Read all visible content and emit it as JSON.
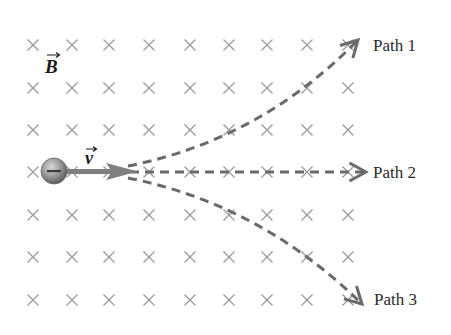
{
  "diagram": {
    "field": {
      "symbol": "B",
      "direction": "into-page",
      "marker": "×",
      "marker_color": "#9a9a9a",
      "columns_x": [
        33,
        72,
        109,
        149,
        190,
        229,
        267,
        307,
        348
      ],
      "rows_y": [
        45,
        88,
        130,
        172,
        215,
        257,
        300
      ]
    },
    "particle": {
      "charge_sign": "−",
      "center": [
        54,
        171
      ],
      "radius": 13,
      "color": "#8a8a8a"
    },
    "velocity": {
      "symbol": "v",
      "color": "#7f7f7f"
    },
    "paths": [
      {
        "label": "Path 1",
        "color": "#6a6a6a"
      },
      {
        "label": "Path 2",
        "color": "#6a6a6a"
      },
      {
        "label": "Path 3",
        "color": "#6a6a6a"
      }
    ]
  }
}
